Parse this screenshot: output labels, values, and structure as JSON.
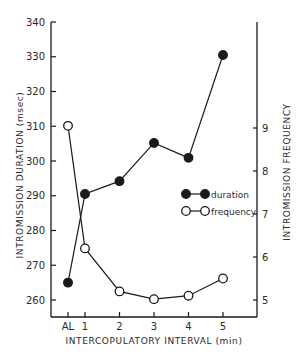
{
  "chart_data": {
    "type": "line",
    "title": "",
    "xlabel": "INTERCOPULATORY INTERVAL (min)",
    "ylabel": "INTROMISSION DURATION (msec)",
    "y2label": "INTROMISSION FREQUENCY",
    "categories": [
      "AL",
      "1",
      "2",
      "3",
      "4",
      "5"
    ],
    "ylim": [
      255,
      340
    ],
    "y2lim": [
      4.6,
      9
    ],
    "yticks": [
      260,
      270,
      280,
      290,
      300,
      310,
      320,
      330,
      340
    ],
    "y2ticks": [
      5,
      6,
      7,
      8,
      9
    ],
    "grid": false,
    "legend_position": "inside-right",
    "series": [
      {
        "name": "duration",
        "axis": "left",
        "marker": "filled-circle",
        "values": [
          265,
          290.5,
          294.2,
          305.2,
          300.9,
          330.5
        ]
      },
      {
        "name": "frequency",
        "axis": "right",
        "marker": "open-circle",
        "values": [
          9.05,
          6.2,
          5.2,
          5.02,
          5.1,
          5.5
        ]
      }
    ]
  },
  "colors": {
    "ink": "#1a1a1a",
    "background": "#ffffff"
  }
}
